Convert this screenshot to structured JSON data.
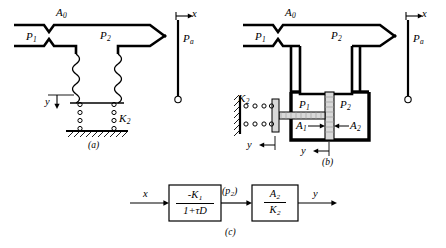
{
  "figure": {
    "panels": [
      {
        "id": "a",
        "caption": "(a)",
        "name": "bellows-type-pneumatic-amplifier",
        "labels": {
          "orifice_area": "A0",
          "supply_pressure": "P1",
          "chamber_pressure": "P2",
          "ambient_pressure": "Pa",
          "input_displacement": "x",
          "output_displacement": "y",
          "spring": "K2"
        }
      },
      {
        "id": "b",
        "caption": "(b)",
        "name": "piston-type-pneumatic-amplifier",
        "labels": {
          "orifice_area": "A0",
          "supply_pressure": "P1",
          "chamber_pressure": "P2",
          "ambient_pressure": "Pa",
          "input_displacement": "x",
          "output_displacement": "y",
          "spring": "K2",
          "piston_area_left": "A1",
          "piston_area_right": "A2",
          "inner_pressure_left": "P1",
          "inner_pressure_right": "P2"
        }
      },
      {
        "id": "c",
        "caption": "(c)",
        "name": "block-diagram",
        "input_label": "x",
        "output_label": "y",
        "intermediate_label": "(p2)",
        "blocks": [
          {
            "numerator": "-K1",
            "denominator": "1+τD"
          },
          {
            "numerator": "A2",
            "denominator": "K2"
          }
        ]
      }
    ],
    "colors": {
      "ink": "#000000",
      "background": "#ffffff",
      "hatch": "#000000"
    }
  }
}
